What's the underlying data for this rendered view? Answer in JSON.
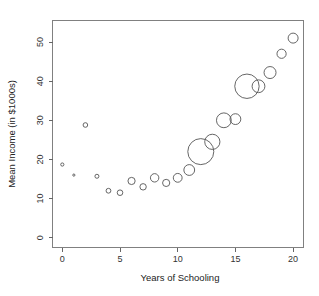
{
  "chart_data": {
    "type": "scatter",
    "title": "",
    "xlabel": "Years of Schooling",
    "ylabel": "Mean Income (in $1000s)",
    "xlim": [
      -0.85,
      20.9
    ],
    "ylim": [
      -2.5,
      55.5
    ],
    "xticks": [
      0,
      5,
      10,
      15,
      20
    ],
    "xtick_labels": [
      "0",
      "5",
      "10",
      "15",
      "20"
    ],
    "yticks": [
      0,
      10,
      20,
      30,
      40,
      50
    ],
    "ytick_labels": [
      "0",
      "10",
      "20",
      "30",
      "40",
      "50"
    ],
    "grid": false,
    "legend": "none",
    "marker": "open-circle",
    "size_encodes": "group sample size",
    "x": [
      0,
      1,
      2,
      3,
      4,
      5,
      6,
      7,
      8,
      9,
      10,
      11,
      12,
      13,
      14,
      15,
      16,
      17,
      18,
      19,
      20
    ],
    "y": [
      18.7,
      16.0,
      28.8,
      15.7,
      12.0,
      11.5,
      14.5,
      13.0,
      15.3,
      14.0,
      15.3,
      17.3,
      22.0,
      24.5,
      30.0,
      30.3,
      38.7,
      38.7,
      42.2,
      47.0,
      51.0
    ],
    "sizes": [
      1.6,
      1.1,
      2.3,
      2.0,
      2.4,
      2.8,
      3.6,
      3.2,
      4.2,
      3.6,
      4.4,
      5.4,
      13.0,
      7.6,
      7.4,
      5.4,
      12.2,
      6.4,
      6.0,
      4.6,
      5.0
    ],
    "points": [
      {
        "x": 0,
        "y": 18.7,
        "r": 1.6
      },
      {
        "x": 1,
        "y": 16.0,
        "r": 1.1
      },
      {
        "x": 2,
        "y": 28.8,
        "r": 2.3
      },
      {
        "x": 3,
        "y": 15.7,
        "r": 2.0
      },
      {
        "x": 4,
        "y": 12.0,
        "r": 2.4
      },
      {
        "x": 5,
        "y": 11.5,
        "r": 2.8
      },
      {
        "x": 6,
        "y": 14.5,
        "r": 3.6
      },
      {
        "x": 7,
        "y": 13.0,
        "r": 3.2
      },
      {
        "x": 8,
        "y": 15.3,
        "r": 4.2
      },
      {
        "x": 9,
        "y": 14.0,
        "r": 3.6
      },
      {
        "x": 10,
        "y": 15.3,
        "r": 4.4
      },
      {
        "x": 11,
        "y": 17.3,
        "r": 5.4
      },
      {
        "x": 12,
        "y": 22.0,
        "r": 13.0
      },
      {
        "x": 13,
        "y": 24.5,
        "r": 7.6
      },
      {
        "x": 14,
        "y": 30.0,
        "r": 7.4
      },
      {
        "x": 15,
        "y": 30.3,
        "r": 5.4
      },
      {
        "x": 16,
        "y": 38.7,
        "r": 12.2
      },
      {
        "x": 17,
        "y": 38.7,
        "r": 6.4
      },
      {
        "x": 18,
        "y": 42.2,
        "r": 6.0
      },
      {
        "x": 19,
        "y": 47.0,
        "r": 4.6
      },
      {
        "x": 20,
        "y": 51.0,
        "r": 5.0
      }
    ],
    "colors": {
      "marker_stroke": "#555555",
      "axis": "#666666",
      "frame": "#808080",
      "text": "#222222",
      "background": "#ffffff"
    }
  }
}
